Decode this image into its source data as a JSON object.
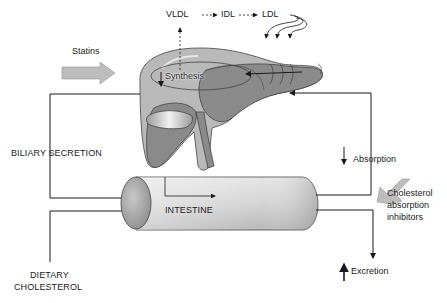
{
  "labels": {
    "vldl": "VLDL",
    "idl": "IDL",
    "ldl": "LDL",
    "statins": "Statins",
    "synthesis": "Synthesis",
    "biliary_secretion": "BILIARY SECRETION",
    "intestine": "INTESTINE",
    "absorption": "Absorption",
    "cholesterol_absorption_inhibitors_line1": "Cholesterol",
    "cholesterol_absorption_inhibitors_line2": "absorption",
    "cholesterol_absorption_inhibitors_line3": "inhibitors",
    "dietary_cholesterol_line1": "DIETARY",
    "dietary_cholesterol_line2": "CHOLESTEROL",
    "excretion": "Excretion"
  },
  "colors": {
    "liver_light": "#b9b9b9",
    "liver_dark": "#8a8a8a",
    "drug_arrow": "#bdbdbd",
    "line": "#1a1a1a",
    "intestine_body": "#d8d8d8",
    "intestine_end": "#a9a9a9"
  }
}
